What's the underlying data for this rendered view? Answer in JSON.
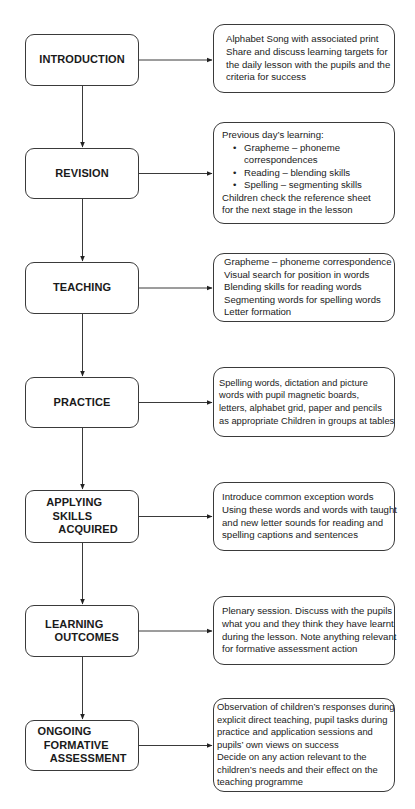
{
  "stages": [
    {
      "label": "INTRODUCTION",
      "description": {
        "lines": [
          "Alphabet Song with associated print",
          "Share and discuss learning targets for",
          "the daily lesson with the pupils and the",
          "criteria for success"
        ]
      }
    },
    {
      "label": "REVISION",
      "description": {
        "intro": "Previous day’s learning:",
        "bullets": [
          "Grapheme – phoneme correspondences",
          "Reading – blending skills",
          "Spelling – segmenting skills"
        ],
        "outro": [
          "Children check the reference sheet",
          "for the next stage in the lesson"
        ]
      }
    },
    {
      "label": "TEACHING",
      "description": {
        "lines": [
          "Grapheme – phoneme correspondence",
          "Visual search for position in words",
          "Blending skills for reading words",
          "Segmenting words for spelling words",
          "Letter formation"
        ]
      }
    },
    {
      "label": "PRACTICE",
      "description": {
        "lines": [
          "Spelling words, dictation and picture",
          "words with pupil magnetic boards,",
          "letters, alphabet grid, paper and pencils",
          "as appropriate Children in groups at tables"
        ]
      }
    },
    {
      "label": "APPLYING\n  SKILLS\n    ACQUIRED",
      "description": {
        "lines": [
          "Introduce common exception words",
          "Using these words and words with taught",
          "and new letter sounds for reading and",
          "spelling captions and sentences"
        ]
      }
    },
    {
      "label": "LEARNING\n   OUTCOMES",
      "description": {
        "lines": [
          "Plenary session. Discuss with the pupils",
          "what you and they think they have learnt",
          "during the lesson. Note anything relevant",
          "for formative assessment action"
        ]
      }
    },
    {
      "label": "ONGOING\n  FORMATIVE\n    ASSESSMENT",
      "description": {
        "lines": [
          "Observation of children’s responses during",
          "explicit direct teaching, pupil tasks during",
          "practice and application sessions and",
          "pupils’ own views on success",
          "Decide on any action relevant to the",
          "children’s needs and their effect on the",
          "teaching programme"
        ]
      }
    }
  ],
  "colors": {
    "stroke": "#3a3a3a",
    "text": "#1a1a1a",
    "background": "#ffffff"
  }
}
